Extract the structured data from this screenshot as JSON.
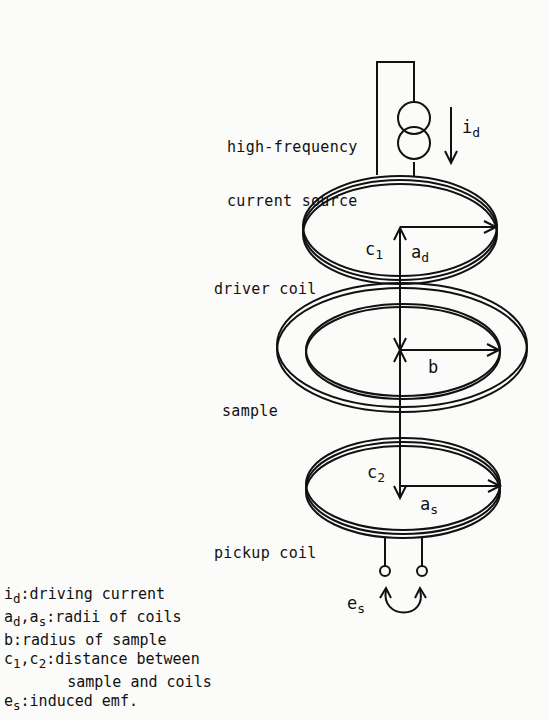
{
  "labels": {
    "source_line1": "high-frequency",
    "source_line2": "current source",
    "driver_coil": "driver coil",
    "sample": "sample",
    "pickup_coil": "pickup coil"
  },
  "symbols": {
    "i": "i",
    "i_sub": "d",
    "c1": "c",
    "c1_sub": "1",
    "ad": "a",
    "ad_sub": "d",
    "b": "b",
    "c2": "c",
    "c2_sub": "2",
    "as": "a",
    "as_sub": "s",
    "es": "e",
    "es_sub": "s"
  },
  "legend": [
    {
      "sym": "i",
      "sub": "d",
      "text": ":driving current"
    },
    {
      "sym": "a",
      "sub": "d",
      "sym2": ",a",
      "sub2": "s",
      "text": ":radii of coils"
    },
    {
      "sym": "b",
      "text": ":radius of sample"
    },
    {
      "sym": "c",
      "sub": "1",
      "sym2": ",c",
      "sub2": "2",
      "text": ":distance between"
    },
    {
      "text": "       sample and coils"
    },
    {
      "sym": "e",
      "sub": "s",
      "text": ":induced emf."
    }
  ]
}
